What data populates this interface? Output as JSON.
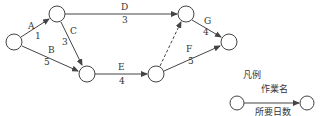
{
  "diagram": {
    "type": "arrow-diagram",
    "nodes": [
      {
        "id": "n1",
        "x": 14,
        "y": 42
      },
      {
        "id": "n2",
        "x": 57,
        "y": 14
      },
      {
        "id": "n3",
        "x": 87,
        "y": 74
      },
      {
        "id": "n4",
        "x": 156,
        "y": 74
      },
      {
        "id": "n5",
        "x": 186,
        "y": 14
      },
      {
        "id": "n6",
        "x": 229,
        "y": 42
      }
    ],
    "activities": [
      {
        "name": "A",
        "days": "1",
        "from": "n1",
        "to": "n2",
        "dummy": false
      },
      {
        "name": "B",
        "days": "5",
        "from": "n1",
        "to": "n3",
        "dummy": false
      },
      {
        "name": "C",
        "days": "3",
        "from": "n2",
        "to": "n3",
        "dummy": false
      },
      {
        "name": "D",
        "days": "3",
        "from": "n2",
        "to": "n5",
        "dummy": false
      },
      {
        "name": "E",
        "days": "4",
        "from": "n3",
        "to": "n4",
        "dummy": false
      },
      {
        "name": "F",
        "days": "5",
        "from": "n4",
        "to": "n6",
        "dummy": false
      },
      {
        "name": "G",
        "days": "4",
        "from": "n5",
        "to": "n6",
        "dummy": false
      },
      {
        "name": "",
        "days": "",
        "from": "n4",
        "to": "n5",
        "dummy": true
      }
    ]
  },
  "legend": {
    "title": "凡例",
    "activity_name": "作業名",
    "duration": "所要日数"
  },
  "colors": {
    "stroke": "#444444",
    "text": "#333333"
  }
}
